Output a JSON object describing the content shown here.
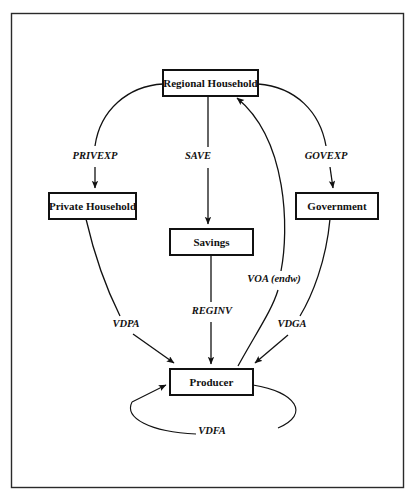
{
  "diagram": {
    "border_color": "#2a2a2a",
    "node_stroke_color": "#111111",
    "edge_color": "#111111",
    "background": "#ffffff",
    "nodes": [
      {
        "id": "regional_household",
        "label": "Regional Household",
        "x": 163,
        "y": 70,
        "w": 95,
        "h": 26
      },
      {
        "id": "private_household",
        "label": "Private Household",
        "x": 49,
        "y": 193,
        "w": 87,
        "h": 26
      },
      {
        "id": "government",
        "label": "Government",
        "x": 296,
        "y": 193,
        "w": 82,
        "h": 26
      },
      {
        "id": "savings",
        "label": "Savings",
        "x": 170,
        "y": 229,
        "w": 83,
        "h": 26
      },
      {
        "id": "producer",
        "label": "Producer",
        "x": 170,
        "y": 369,
        "w": 83,
        "h": 26
      }
    ],
    "edges": [
      {
        "id": "privexp",
        "label": "PRIVEXP",
        "from": "regional_household",
        "to": "private_household",
        "label_x": 95,
        "label_y": 157
      },
      {
        "id": "save",
        "label": "SAVE",
        "from": "regional_household",
        "to": "savings",
        "label_x": 198,
        "label_y": 157
      },
      {
        "id": "govexp",
        "label": "GOVEXP",
        "from": "regional_household",
        "to": "government",
        "label_x": 326,
        "label_y": 157
      },
      {
        "id": "voa",
        "label": "VOA (endw)",
        "from": "producer",
        "to": "regional_household",
        "label_x": 274,
        "label_y": 280
      },
      {
        "id": "reginv",
        "label": "REGINV",
        "from": "savings",
        "to": "producer",
        "label_x": 212,
        "label_y": 312
      },
      {
        "id": "vdpa",
        "label": "VDPA",
        "from": "private_household",
        "to": "producer",
        "label_x": 126,
        "label_y": 325
      },
      {
        "id": "vdga",
        "label": "VDGA",
        "from": "government",
        "to": "producer",
        "label_x": 292,
        "label_y": 325
      },
      {
        "id": "vdfa",
        "label": "VDFA",
        "from": "producer",
        "to": "producer",
        "label_x": 212,
        "label_y": 432
      }
    ]
  }
}
